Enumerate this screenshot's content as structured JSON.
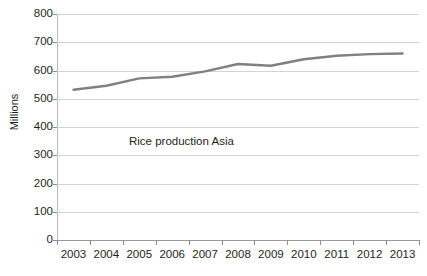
{
  "chart_data": {
    "type": "line",
    "title": "",
    "subtitle": "",
    "xlabel": "",
    "ylabel": "Millions",
    "categories": [
      "2003",
      "2004",
      "2005",
      "2006",
      "2007",
      "2008",
      "2009",
      "2010",
      "2011",
      "2012",
      "2013"
    ],
    "series": [
      {
        "name": "Rice production Asia",
        "color": "#808080",
        "values": [
          532,
          546,
          572,
          578,
          597,
          623,
          617,
          640,
          652,
          658,
          660
        ]
      }
    ],
    "ylim": [
      0,
      800
    ],
    "y_ticks": [
      0,
      100,
      200,
      300,
      400,
      500,
      600,
      700,
      800
    ],
    "y_tick_labels": [
      "0",
      "100",
      "200",
      "300",
      "400",
      "500",
      "600",
      "700",
      "800"
    ],
    "grid": true,
    "grid_axis": "y",
    "legend": false,
    "legend_position": "none",
    "annotations": [
      {
        "text": "Rice production Asia",
        "x_category": "2005",
        "y_value": 345
      }
    ],
    "colors": {
      "series_line": "#808080",
      "gridline": "#d3d3d3",
      "axis_line": "#8d8d8d",
      "text": "#231f20",
      "background": "#ffffff"
    }
  }
}
